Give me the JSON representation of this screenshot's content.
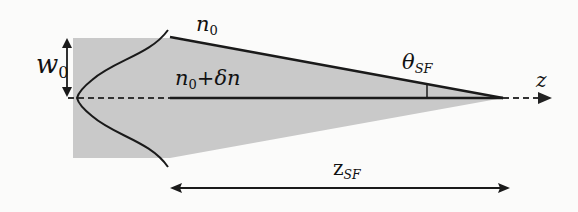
{
  "diagram": {
    "labels": {
      "w0": {
        "main": "w",
        "sub": "0"
      },
      "n0": {
        "main": "n",
        "sub": "0"
      },
      "n0_delta": {
        "main": "n",
        "sub": "0",
        "rest": "+δn"
      },
      "theta_sf": {
        "main": "θ",
        "sub": "SF"
      },
      "z_axis": "z",
      "z_sf": {
        "main": "z",
        "sub": "SF"
      }
    },
    "colors": {
      "fill": "#c9c9c9",
      "line": "#1a1a1a",
      "background": "#fbfbfa"
    }
  }
}
